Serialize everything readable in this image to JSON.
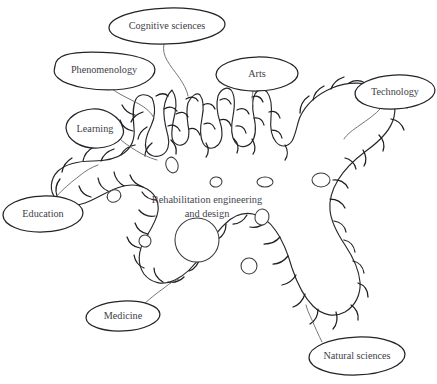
{
  "diagram": {
    "title_center": {
      "line1": "Rehabilitation engineering",
      "line2": "and design"
    },
    "style": {
      "background": "#ffffff",
      "outline_color": "#26262b",
      "spike_color": "#1d1d22",
      "connector_color": "#6e6e74",
      "label_text_color": "#3e3e47",
      "center_text_color": "#45454e",
      "bubble_fill": "#ffffff"
    },
    "nodes": [
      {
        "id": "cognitive-sciences",
        "label": "Cognitive sciences",
        "icon": "ellipse-callout-icon",
        "cx": 167,
        "cy": 26,
        "rx": 58,
        "ry": 18
      },
      {
        "id": "phenomenology",
        "label": "Phenomenology",
        "icon": "ellipse-callout-icon",
        "cx": 104,
        "cy": 72,
        "rx": 51,
        "ry": 18
      },
      {
        "id": "arts",
        "label": "Arts",
        "icon": "ellipse-callout-icon",
        "cx": 257,
        "cy": 74,
        "rx": 41,
        "ry": 17
      },
      {
        "id": "technology",
        "label": "Technology",
        "icon": "ellipse-callout-icon",
        "cx": 395,
        "cy": 92,
        "rx": 40,
        "ry": 17
      },
      {
        "id": "learning",
        "label": "Learning",
        "icon": "ellipse-callout-icon",
        "cx": 94,
        "cy": 131,
        "rx": 32,
        "ry": 17
      },
      {
        "id": "education",
        "label": "Education",
        "icon": "ellipse-callout-icon",
        "cx": 43,
        "cy": 214,
        "rx": 40,
        "ry": 17
      },
      {
        "id": "medicine",
        "label": "Medicine",
        "icon": "ellipse-callout-icon",
        "cx": 123,
        "cy": 316,
        "rx": 36,
        "ry": 15
      },
      {
        "id": "natural-sciences",
        "label": "Natural sciences",
        "icon": "ellipse-callout-icon",
        "cx": 357,
        "cy": 356,
        "rx": 48,
        "ry": 18
      }
    ]
  }
}
